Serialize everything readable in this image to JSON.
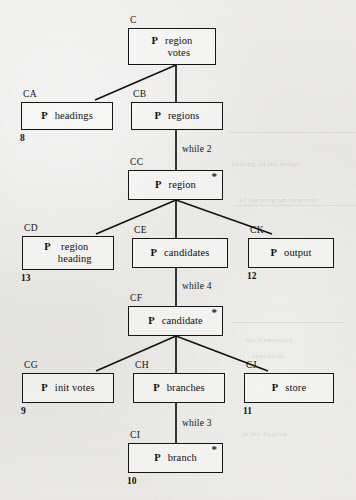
{
  "diagram": {
    "nodes": [
      {
        "id": "C",
        "prefix": "P",
        "lines": [
          "region",
          "votes"
        ],
        "iteration": "",
        "ref": "",
        "x": 128,
        "y": 28,
        "w": 88,
        "h": 37
      },
      {
        "id": "CA",
        "prefix": "P",
        "lines": [
          "headings"
        ],
        "iteration": "",
        "ref": "8",
        "x": 21,
        "y": 102,
        "w": 92,
        "h": 28
      },
      {
        "id": "CB",
        "prefix": "P",
        "lines": [
          "regions"
        ],
        "iteration": "",
        "ref": "",
        "x": 131,
        "y": 102,
        "w": 92,
        "h": 28
      },
      {
        "id": "CC",
        "prefix": "P",
        "lines": [
          "region"
        ],
        "iteration": "*",
        "ref": "",
        "x": 128,
        "y": 170,
        "w": 95,
        "h": 30
      },
      {
        "id": "CD",
        "prefix": "P",
        "lines": [
          "region",
          "heading"
        ],
        "iteration": "",
        "ref": "13",
        "x": 22,
        "y": 236,
        "w": 92,
        "h": 34
      },
      {
        "id": "CE",
        "prefix": "P",
        "lines": [
          "candidates"
        ],
        "iteration": "",
        "ref": "",
        "x": 132,
        "y": 238,
        "w": 96,
        "h": 30
      },
      {
        "id": "CK",
        "prefix": "P",
        "lines": [
          "output"
        ],
        "iteration": "",
        "ref": "12",
        "x": 248,
        "y": 238,
        "w": 86,
        "h": 30
      },
      {
        "id": "CF",
        "prefix": "P",
        "lines": [
          "candidate"
        ],
        "iteration": "*",
        "ref": "",
        "x": 128,
        "y": 306,
        "w": 95,
        "h": 30
      },
      {
        "id": "CG",
        "prefix": "P",
        "lines": [
          "init votes"
        ],
        "iteration": "",
        "ref": "9",
        "x": 22,
        "y": 373,
        "w": 92,
        "h": 30
      },
      {
        "id": "CH",
        "prefix": "P",
        "lines": [
          "branches"
        ],
        "iteration": "",
        "ref": "",
        "x": 133,
        "y": 373,
        "w": 92,
        "h": 30
      },
      {
        "id": "CJ",
        "prefix": "P",
        "lines": [
          "store"
        ],
        "iteration": "",
        "ref": "11",
        "x": 244,
        "y": 373,
        "w": 90,
        "h": 30
      },
      {
        "id": "CI",
        "prefix": "P",
        "lines": [
          "branch"
        ],
        "iteration": "*",
        "ref": "10",
        "x": 128,
        "y": 443,
        "w": 95,
        "h": 30
      }
    ],
    "conditions": [
      {
        "text": "while 2",
        "x": 182,
        "y": 144
      },
      {
        "text": "while 4",
        "x": 182,
        "y": 281
      },
      {
        "text": "while 3",
        "x": 182,
        "y": 418
      }
    ],
    "links": [
      {
        "from": "C",
        "to": "CA",
        "x1": 176,
        "y1": 65,
        "x2": 95,
        "y2": 100
      },
      {
        "from": "C",
        "to": "CB",
        "x1": 176,
        "y1": 65,
        "x2": 176,
        "y2": 102
      },
      {
        "from": "CB",
        "to": "CC",
        "x1": 176,
        "y1": 130,
        "x2": 176,
        "y2": 170
      },
      {
        "from": "CC",
        "to": "CD",
        "x1": 176,
        "y1": 200,
        "x2": 96,
        "y2": 234
      },
      {
        "from": "CC",
        "to": "CE",
        "x1": 176,
        "y1": 200,
        "x2": 176,
        "y2": 238
      },
      {
        "from": "CC",
        "to": "CK",
        "x1": 176,
        "y1": 200,
        "x2": 272,
        "y2": 234
      },
      {
        "from": "CE",
        "to": "CF",
        "x1": 176,
        "y1": 268,
        "x2": 176,
        "y2": 306
      },
      {
        "from": "CF",
        "to": "CG",
        "x1": 176,
        "y1": 336,
        "x2": 96,
        "y2": 371
      },
      {
        "from": "CF",
        "to": "CH",
        "x1": 176,
        "y1": 336,
        "x2": 176,
        "y2": 373
      },
      {
        "from": "CF",
        "to": "CJ",
        "x1": 176,
        "y1": 336,
        "x2": 268,
        "y2": 371
      },
      {
        "from": "CH",
        "to": "CI",
        "x1": 176,
        "y1": 403,
        "x2": 176,
        "y2": 443
      }
    ],
    "ghost_text": [
      {
        "text": "bearing on the design",
        "x": 232,
        "y": 160
      },
      {
        "text": "of the program structure",
        "x": 240,
        "y": 196
      },
      {
        "text": "the elementary",
        "x": 246,
        "y": 336
      },
      {
        "text": "operations",
        "x": 252,
        "y": 352
      },
      {
        "text": "in the diagram",
        "x": 242,
        "y": 430
      }
    ]
  }
}
